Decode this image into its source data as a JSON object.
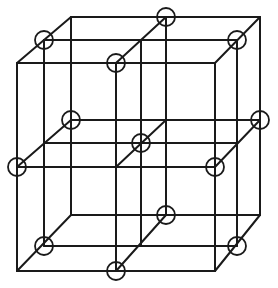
{
  "diagram": {
    "type": "cubic-lattice",
    "colors": {
      "line": "#1a1a1a",
      "background": "#ffffff"
    },
    "planes": [
      {
        "name": "front",
        "xs": [
          17,
          116,
          215
        ],
        "ys": [
          63,
          167,
          271
        ]
      },
      {
        "name": "middle",
        "xs": [
          44,
          141,
          237
        ],
        "ys": [
          40,
          143,
          246
        ]
      },
      {
        "name": "back",
        "xs": [
          71,
          166,
          260
        ],
        "ys": [
          17,
          120,
          215
        ]
      }
    ],
    "circle_radius": 9,
    "circled_points": [
      {
        "plane": 1,
        "i": 0,
        "j": 0
      },
      {
        "plane": 0,
        "i": 1,
        "j": 0
      },
      {
        "plane": 2,
        "i": 1,
        "j": 0
      },
      {
        "plane": 1,
        "i": 2,
        "j": 0
      },
      {
        "plane": 2,
        "i": 0,
        "j": 1
      },
      {
        "plane": 1,
        "i": 1,
        "j": 1
      },
      {
        "plane": 2,
        "i": 2,
        "j": 1
      },
      {
        "plane": 0,
        "i": 0,
        "j": 1
      },
      {
        "plane": 0,
        "i": 2,
        "j": 1
      },
      {
        "plane": 1,
        "i": 0,
        "j": 2
      },
      {
        "plane": 2,
        "i": 1,
        "j": 2
      },
      {
        "plane": 1,
        "i": 2,
        "j": 2
      },
      {
        "plane": 0,
        "i": 1,
        "j": 2
      }
    ]
  }
}
